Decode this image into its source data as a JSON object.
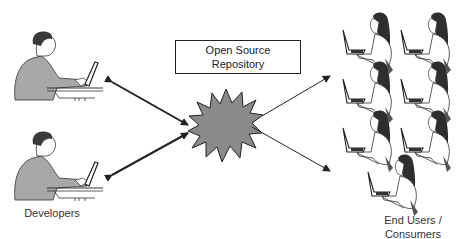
{
  "repository": {
    "line1": "Open Source",
    "line2": "Repository"
  },
  "developers": {
    "label": "Developers",
    "count": 2
  },
  "end_users": {
    "line1": "End Users /",
    "line2": "Consumers",
    "count": 7
  },
  "colors": {
    "starburst_fill": "#8a8a8a",
    "stroke": "#222222",
    "developer_shirt": "#a8a8a8",
    "hair": "#3a3a3a"
  }
}
